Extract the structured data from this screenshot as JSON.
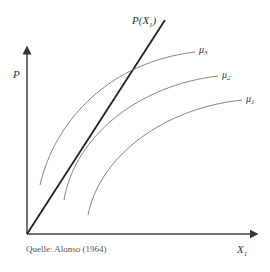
{
  "diagram": {
    "y_axis_label": "P",
    "x_axis_label": "X",
    "x_axis_sub": "1",
    "line_label": "P(X",
    "line_label_sub": "1",
    "line_label_close": ")",
    "curves": [
      {
        "name": "μ",
        "sub": "3"
      },
      {
        "name": "μ",
        "sub": "2"
      },
      {
        "name": "μ",
        "sub": "1"
      }
    ],
    "source": "Quelle: Alonso (1964)",
    "colors": {
      "axis": "#333333",
      "line": "#222222",
      "curve": "#777777"
    }
  }
}
